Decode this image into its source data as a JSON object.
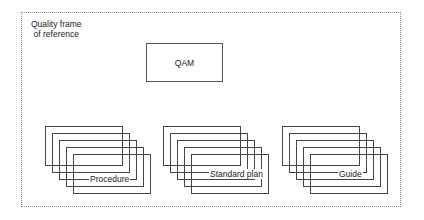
{
  "diagram": {
    "frame": {
      "title_line1": "Quality frame",
      "title_line2": "of reference"
    },
    "qam": {
      "label": "QAM"
    },
    "stacks": [
      {
        "label": "Procedure",
        "x": 45,
        "y": 126,
        "count": 5,
        "offset_x": 7,
        "offset_y": 7
      },
      {
        "label": "Standard plan",
        "x": 163,
        "y": 126,
        "count": 5,
        "offset_x": 7,
        "offset_y": 7
      },
      {
        "label": "Guide",
        "x": 282,
        "y": 126,
        "count": 5,
        "offset_x": 7,
        "offset_y": 7
      }
    ],
    "colors": {
      "stroke": "#444444",
      "frame_border": "#888888",
      "background": "#ffffff"
    }
  }
}
